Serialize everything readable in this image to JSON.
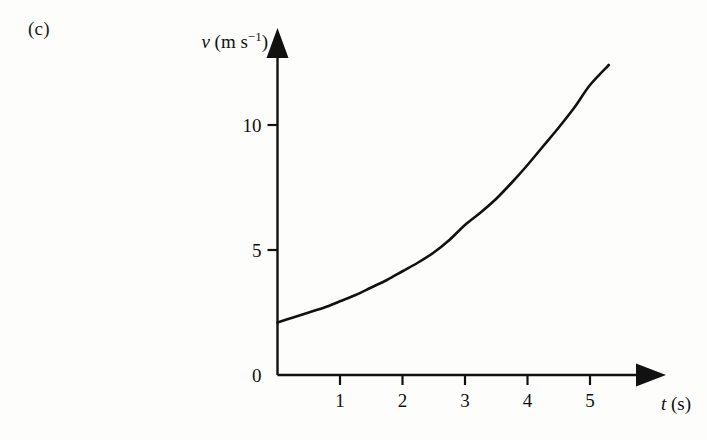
{
  "figure": {
    "part_label": "(c)",
    "background_color": "#fdfdfb",
    "ink_color": "#111111"
  },
  "chart_data": {
    "type": "line",
    "title": "",
    "subtitle": "",
    "xlabel": "t (s)",
    "ylabel": "v (m s−1)",
    "ylabel_symbol": "v",
    "ylabel_units": "(m s",
    "ylabel_exponent": "−1",
    "ylabel_close": ")",
    "xlabel_symbol": "t",
    "xlabel_units": "(s)",
    "xlim": [
      0,
      6.2
    ],
    "ylim": [
      0,
      13.2
    ],
    "xticks": [
      1,
      2,
      3,
      4,
      5
    ],
    "xtick_labels": [
      "1",
      "2",
      "3",
      "4",
      "5"
    ],
    "yticks": [
      0,
      5,
      10
    ],
    "ytick_labels": [
      "0",
      "5",
      "10"
    ],
    "grid": false,
    "legend": false,
    "axis_arrows": true,
    "series": [
      {
        "name": "velocity",
        "color": "#111111",
        "line_width": 2.6,
        "x": [
          0.0,
          0.25,
          0.5,
          0.75,
          1.0,
          1.25,
          1.5,
          1.75,
          2.0,
          2.25,
          2.5,
          2.75,
          3.0,
          3.25,
          3.5,
          3.75,
          4.0,
          4.25,
          4.5,
          4.75,
          5.0,
          5.3
        ],
        "y": [
          2.1,
          2.3,
          2.5,
          2.7,
          2.95,
          3.2,
          3.5,
          3.8,
          4.15,
          4.5,
          4.9,
          5.4,
          6.0,
          6.5,
          7.05,
          7.7,
          8.4,
          9.15,
          9.9,
          10.7,
          11.6,
          12.4
        ]
      }
    ],
    "annotations": []
  }
}
